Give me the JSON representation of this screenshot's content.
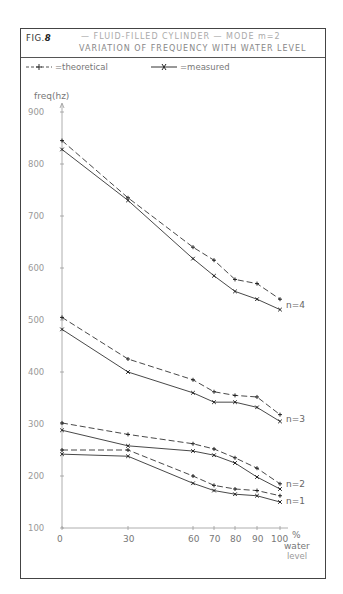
{
  "figure": {
    "fig_number": "8",
    "fig_prefix": "FIG.",
    "title_line1": "— FLUID-FILLED CYLINDER — MODE m=2",
    "title_line2": "VARIATION OF FREQUENCY WITH WATER LEVEL"
  },
  "legend": {
    "theoretical": "=theoretical",
    "measured": "=measured"
  },
  "axes": {
    "ylabel": "freq(hz)",
    "xlabel_line1": "%",
    "xlabel_line2": "water",
    "xlabel_line3": "level"
  },
  "chart_data": {
    "type": "line",
    "xlabel": "% water level",
    "ylabel": "freq(hz)",
    "x": [
      0,
      30,
      60,
      70,
      80,
      90,
      100
    ],
    "x_ticks": [
      0,
      30,
      60,
      70,
      80,
      90,
      100
    ],
    "y_ticks": [
      100,
      200,
      300,
      400,
      500,
      600,
      700,
      800,
      900
    ],
    "ylim": [
      100,
      900
    ],
    "xlim": [
      0,
      100
    ],
    "grid": false,
    "legend_position": "top",
    "series": [
      {
        "name": "n=4 theoretical",
        "style": "dashed",
        "values": [
          845,
          735,
          640,
          615,
          578,
          570,
          540
        ]
      },
      {
        "name": "n=4 measured",
        "style": "solid",
        "values": [
          828,
          730,
          618,
          585,
          555,
          540,
          520
        ]
      },
      {
        "name": "n=3 theoretical",
        "style": "dashed",
        "values": [
          505,
          425,
          385,
          362,
          355,
          352,
          318
        ]
      },
      {
        "name": "n=3 measured",
        "style": "solid",
        "values": [
          482,
          400,
          360,
          342,
          342,
          332,
          305
        ]
      },
      {
        "name": "n=2 theoretical",
        "style": "dashed",
        "values": [
          302,
          280,
          262,
          252,
          235,
          215,
          185
        ]
      },
      {
        "name": "n=2 measured",
        "style": "solid",
        "values": [
          288,
          258,
          248,
          240,
          225,
          198,
          175
        ]
      },
      {
        "name": "n=1 theoretical",
        "style": "dashed",
        "values": [
          250,
          250,
          200,
          182,
          175,
          172,
          162
        ]
      },
      {
        "name": "n=1 measured",
        "style": "solid",
        "values": [
          242,
          238,
          186,
          172,
          165,
          162,
          150
        ]
      }
    ],
    "annotations": [
      "n=4",
      "n=3",
      "n=2",
      "n=1"
    ]
  }
}
